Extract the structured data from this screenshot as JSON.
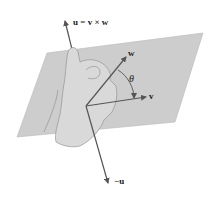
{
  "figure": {
    "labels": {
      "u": "u = v × w",
      "w": "w",
      "v": "v",
      "theta": "θ",
      "neg_u": "−u"
    },
    "colors": {
      "plane": "#c8c8c8",
      "plane_edge": "#b0b0b0",
      "hand": "#d6d6d6",
      "hand_outline": "#8a8a8a",
      "vector": "#555555",
      "text": "#1a1a1a"
    }
  }
}
